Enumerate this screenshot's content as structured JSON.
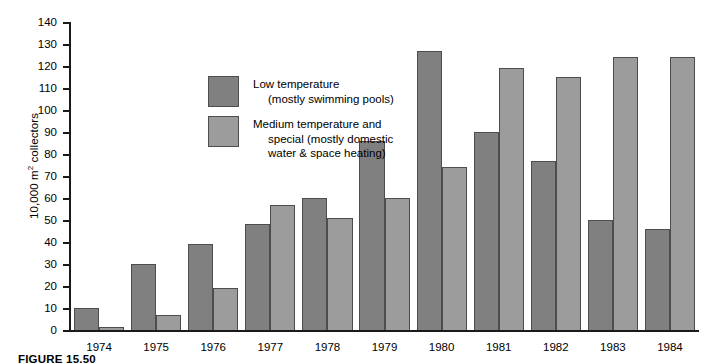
{
  "figure": {
    "caption": "FIGURE 15.50"
  },
  "chart_data": {
    "type": "bar",
    "title": "",
    "xlabel": "",
    "ylabel": "10,000 m² collectors",
    "ylabel_prefix": "10,000 m",
    "ylabel_sup": "2",
    "ylabel_suffix": " collectors",
    "ylim": [
      0,
      140
    ],
    "ytick_step": 10,
    "yticks": [
      140,
      130,
      120,
      110,
      100,
      90,
      80,
      70,
      60,
      50,
      40,
      30,
      20,
      10,
      0
    ],
    "grid": false,
    "legend_position": "inside-upper-left",
    "categories": [
      "1974",
      "1975",
      "1976",
      "1977",
      "1978",
      "1979",
      "1980",
      "1981",
      "1982",
      "1983",
      "1984"
    ],
    "series": [
      {
        "name": "Low temperature (mostly swimming pools)",
        "name_line1": "Low temperature",
        "name_line2": "(mostly swimming pools)",
        "color": "#808080",
        "values": [
          10,
          30,
          39,
          48,
          60,
          86,
          127,
          90,
          77,
          50,
          46
        ]
      },
      {
        "name": "Medium temperature and special (mostly domestic water & space heating)",
        "name_line1": "Medium temperature and",
        "name_line2": "special (mostly domestic",
        "name_line3": "water & space heating)",
        "color": "#9c9c9c",
        "values": [
          1.5,
          7,
          19,
          57,
          51,
          60,
          74,
          119,
          115,
          124,
          124
        ]
      }
    ]
  }
}
